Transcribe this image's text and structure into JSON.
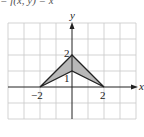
{
  "header": {
    "fragment_text": "= f(x, y) = x"
  },
  "figure": {
    "axis_labels": {
      "x": "x",
      "y": "y"
    },
    "tick_labels": {
      "x_neg2": "−2",
      "x_pos2": "2",
      "y_2": "2",
      "y_1": "1"
    },
    "region": {
      "vertices": [
        [
          -2,
          0
        ],
        [
          0,
          2
        ],
        [
          2,
          0
        ],
        [
          0,
          1
        ]
      ],
      "fill_color": "#b8b8b8",
      "stroke_color": "#222222"
    },
    "grid": {
      "x_range": [
        -4,
        4
      ],
      "y_range": [
        -2,
        4
      ],
      "spacing": 1,
      "color": "#c8c8c8"
    }
  }
}
